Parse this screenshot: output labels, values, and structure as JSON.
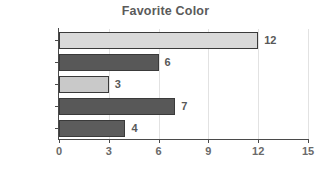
{
  "chart_data": {
    "type": "bar",
    "orientation": "horizontal",
    "title": "Favorite Color",
    "xlabel": "",
    "ylabel": "",
    "categories": [
      "Cyan",
      "Purple",
      "Green",
      "Red",
      "Blue"
    ],
    "values": [
      12,
      6,
      3,
      7,
      4
    ],
    "bar_colors": [
      "#d9d9d9",
      "#585858",
      "#c9c9c9",
      "#585858",
      "#5c5c5c"
    ],
    "bar_border_color": "#3a3a3a",
    "value_labels": [
      "12",
      "6",
      "3",
      "7",
      "4"
    ],
    "xlim": [
      0,
      15
    ],
    "xticks": [
      0,
      3,
      6,
      9,
      12,
      15
    ],
    "xtick_labels": [
      "0",
      "3",
      "6",
      "9",
      "12",
      "15"
    ],
    "grid": true,
    "grid_axis": "x",
    "grid_color": "#e2e2e2",
    "legend": false,
    "background_color": "#ffffff",
    "title_color": "#5a5a5a",
    "tick_label_color": "#6a6a6a",
    "category_label_color": "#6d6d6d"
  }
}
